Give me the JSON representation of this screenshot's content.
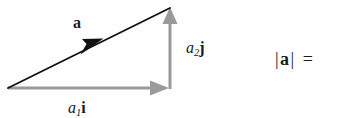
{
  "figure": {
    "width": 337,
    "height": 118,
    "background_color": "#fefefe"
  },
  "colors": {
    "resultant_vector": "#111111",
    "component_vector": "#9a9a9a",
    "text": "#1a1a1a"
  },
  "geometry": {
    "origin": {
      "x": 8,
      "y": 88
    },
    "tip": {
      "x": 170,
      "y": 8
    },
    "corner": {
      "x": 170,
      "y": 88
    },
    "resultant_arrowhead_midpoint": {
      "x": 95,
      "y": 46
    }
  },
  "labels": {
    "resultant": {
      "name": "a",
      "style": "bold-italic-vector"
    },
    "vertical_component": {
      "scalar": "a",
      "subscript": "2",
      "unit": "j"
    },
    "horizontal_component": {
      "scalar": "a",
      "subscript": "1",
      "unit": "i"
    },
    "magnitude_expression": {
      "open_bar": "|",
      "vector": "a",
      "close_bar": "|",
      "equals": "="
    }
  }
}
